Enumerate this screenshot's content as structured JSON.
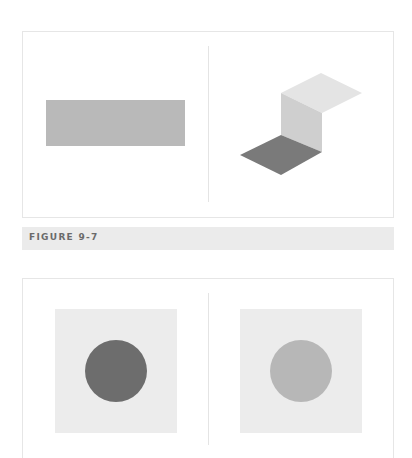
{
  "figure": {
    "caption": "FIGURE 9-7"
  },
  "top_panel": {
    "left_shape": {
      "type": "rectangle",
      "color": "#b9b9b9"
    },
    "right_shape": {
      "type": "isometric-fold",
      "top_face_color": "#e4e4e4",
      "vertical_face_color": "#cfcfcf",
      "bottom_face_color": "#7a7a7a"
    }
  },
  "bottom_panel": {
    "left": {
      "background": "#ececec",
      "circle_color": "#6d6d6d"
    },
    "right": {
      "background": "#ececec",
      "circle_color": "#b7b7b7"
    }
  }
}
